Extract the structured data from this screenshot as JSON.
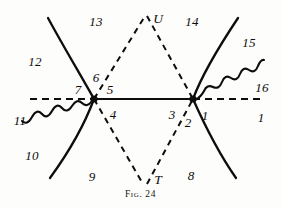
{
  "figure": {
    "caption": "Fig. 24",
    "width": 281,
    "height": 209,
    "ink_color": "#0d0d0d",
    "background_color": "#fdfdfb"
  },
  "vertices": [
    {
      "name": "left-vertex",
      "x": 94,
      "y": 99
    },
    {
      "name": "right-vertex",
      "x": 193,
      "y": 99
    }
  ],
  "point_labels": [
    {
      "id": "U",
      "text": "U",
      "x": 158,
      "y": 19
    },
    {
      "id": "T",
      "text": "T",
      "x": 158,
      "y": 180
    }
  ],
  "region_labels": [
    {
      "id": "1a",
      "text": "1",
      "x": 205,
      "y": 115
    },
    {
      "id": "1b",
      "text": "1",
      "x": 261,
      "y": 117
    },
    {
      "id": "2",
      "text": "2",
      "x": 188,
      "y": 122
    },
    {
      "id": "3",
      "text": "3",
      "x": 172,
      "y": 114
    },
    {
      "id": "4",
      "text": "4",
      "x": 113,
      "y": 114
    },
    {
      "id": "5",
      "text": "5",
      "x": 110,
      "y": 89
    },
    {
      "id": "6",
      "text": "6",
      "x": 96,
      "y": 77
    },
    {
      "id": "7",
      "text": "7",
      "x": 78,
      "y": 89
    },
    {
      "id": "8",
      "text": "8",
      "x": 191,
      "y": 175
    },
    {
      "id": "9",
      "text": "9",
      "x": 92,
      "y": 176
    },
    {
      "id": "10",
      "text": "10",
      "x": 32,
      "y": 155
    },
    {
      "id": "11",
      "text": "11",
      "x": 20,
      "y": 120
    },
    {
      "id": "12",
      "text": "12",
      "x": 35,
      "y": 61
    },
    {
      "id": "13",
      "text": "13",
      "x": 96,
      "y": 21
    },
    {
      "id": "14",
      "text": "14",
      "x": 192,
      "y": 21
    },
    {
      "id": "15",
      "text": "15",
      "x": 249,
      "y": 42
    },
    {
      "id": "16",
      "text": "16",
      "x": 262,
      "y": 87
    }
  ],
  "strokes": {
    "axis_solid_segment": {
      "name": "vertex-connector-line",
      "style": "solid",
      "from": {
        "x": 94,
        "y": 99
      },
      "to": {
        "x": 193,
        "y": 99
      }
    },
    "axis_dashed_left": {
      "name": "axis-dashed-left",
      "style": "dashed",
      "from": {
        "x": 30,
        "y": 99
      },
      "to": {
        "x": 94,
        "y": 99
      }
    },
    "axis_dashed_right": {
      "name": "axis-dashed-right",
      "style": "dashed",
      "from": {
        "x": 193,
        "y": 99
      },
      "to": {
        "x": 262,
        "y": 99
      }
    },
    "dashed_upper_left_leg": {
      "name": "dashed-leg-left-to-u",
      "style": "dashed",
      "from": {
        "x": 94,
        "y": 99
      },
      "to": {
        "x": 145,
        "y": 16
      }
    },
    "dashed_upper_right_leg": {
      "name": "dashed-leg-u-to-right",
      "style": "dashed",
      "from": {
        "x": 145,
        "y": 16
      },
      "to": {
        "x": 193,
        "y": 99
      }
    },
    "dashed_lower_left_leg": {
      "name": "dashed-leg-left-to-t",
      "style": "dashed",
      "from": {
        "x": 94,
        "y": 99
      },
      "to": {
        "x": 145,
        "y": 184
      }
    },
    "dashed_lower_right_leg": {
      "name": "dashed-leg-t-to-right",
      "style": "dashed",
      "from": {
        "x": 145,
        "y": 184
      },
      "to": {
        "x": 193,
        "y": 99
      }
    },
    "curve_upper_left": {
      "name": "curve-upper-left",
      "style": "solid-curve",
      "from": {
        "x": 48,
        "y": 18
      },
      "to": {
        "x": 94,
        "y": 99
      }
    },
    "curve_lower_left": {
      "name": "curve-lower-left",
      "style": "solid-curve",
      "from": {
        "x": 94,
        "y": 99
      },
      "to": {
        "x": 50,
        "y": 178
      }
    },
    "curve_upper_right": {
      "name": "curve-upper-right",
      "style": "solid-curve",
      "from": {
        "x": 193,
        "y": 99
      },
      "to": {
        "x": 238,
        "y": 18
      }
    },
    "curve_lower_right": {
      "name": "curve-lower-right",
      "style": "solid-curve",
      "from": {
        "x": 193,
        "y": 99
      },
      "to": {
        "x": 236,
        "y": 178
      }
    },
    "wavy_left": {
      "name": "wavy-line-left",
      "style": "wavy",
      "from": {
        "x": 94,
        "y": 99
      },
      "to": {
        "x": 22,
        "y": 134
      }
    },
    "wavy_right": {
      "name": "wavy-line-right",
      "style": "wavy",
      "from": {
        "x": 193,
        "y": 99
      },
      "to": {
        "x": 258,
        "y": 65
      }
    }
  }
}
